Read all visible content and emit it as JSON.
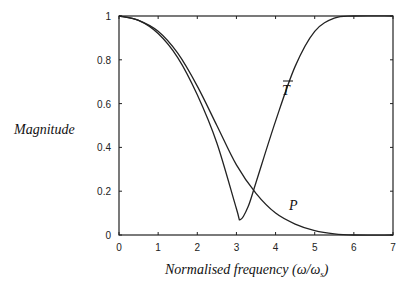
{
  "chart_data": {
    "type": "line",
    "title": "",
    "xlabel": "Normalised frequency (ω/ω_s)",
    "ylabel": "Magnitude",
    "xlim": [
      0,
      7
    ],
    "ylim": [
      0,
      1
    ],
    "xticks": [
      0,
      1,
      2,
      3,
      4,
      5,
      6,
      7
    ],
    "yticks": [
      0,
      0.2,
      0.4,
      0.6,
      0.8,
      1
    ],
    "grid": false,
    "series": [
      {
        "name": "T̄",
        "x": [
          0,
          0.5,
          1,
          1.5,
          2,
          2.5,
          3,
          3.1,
          3.3,
          3.5,
          4,
          4.5,
          5,
          5.5,
          6,
          7
        ],
        "values": [
          1,
          0.98,
          0.92,
          0.81,
          0.64,
          0.42,
          0.12,
          0.07,
          0.13,
          0.24,
          0.52,
          0.77,
          0.93,
          0.99,
          1,
          1
        ]
      },
      {
        "name": "P",
        "x": [
          0,
          0.5,
          1,
          1.5,
          2,
          2.5,
          3,
          3.5,
          4,
          4.5,
          5,
          5.5,
          6,
          7
        ],
        "values": [
          1,
          0.98,
          0.93,
          0.83,
          0.68,
          0.5,
          0.32,
          0.19,
          0.1,
          0.05,
          0.02,
          0.005,
          0,
          0
        ]
      }
    ],
    "annotations": [
      {
        "text": "T̄",
        "x": 4.45,
        "y": 0.68
      },
      {
        "text": "P",
        "x": 4.55,
        "y": 0.14
      }
    ]
  },
  "labels": {
    "ylabel": "Magnitude",
    "xlabel_prefix": "Normalised frequency (ω/ω",
    "xlabel_sub": "s",
    "xlabel_suffix": ")",
    "t_label": "T",
    "p_label": "P"
  }
}
